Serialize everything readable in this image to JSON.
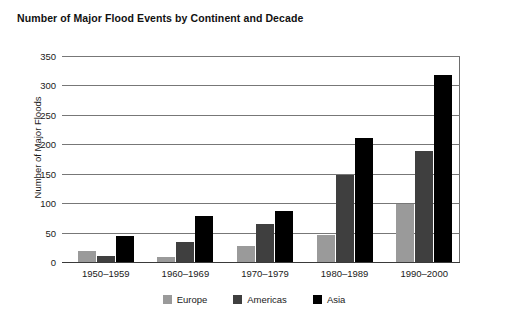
{
  "chart_data": {
    "type": "bar",
    "title": "Number of Major Flood Events by Continent and Decade",
    "xlabel": "",
    "ylabel": "Number of Major Floods",
    "categories": [
      "1950–1959",
      "1960–1969",
      "1970–1979",
      "1980–1989",
      "1990–2000"
    ],
    "series": [
      {
        "name": "Europe",
        "color": "#9a9a9a",
        "values": [
          18,
          9,
          28,
          46,
          98
        ]
      },
      {
        "name": "Americas",
        "color": "#3f3f3f",
        "values": [
          10,
          34,
          65,
          148,
          188
        ]
      },
      {
        "name": "Asia",
        "color": "#000000",
        "values": [
          44,
          78,
          87,
          210,
          318
        ]
      }
    ],
    "ylim": [
      0,
      350
    ],
    "yticks": [
      0,
      50,
      100,
      150,
      200,
      250,
      300,
      350
    ],
    "ytick_labels": [
      "0",
      "50",
      "100",
      "150",
      "200",
      "250",
      "300",
      "350"
    ],
    "grid": true,
    "legend_position": "bottom"
  }
}
